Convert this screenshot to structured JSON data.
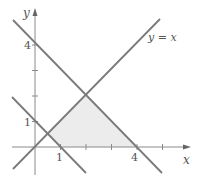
{
  "diagram": {
    "type": "linear-inequality-region",
    "axes": {
      "x_label": "x",
      "y_label": "y",
      "x_ticks": [
        1,
        2,
        3,
        4,
        5
      ],
      "y_ticks": [
        1,
        2,
        3,
        4
      ],
      "x_tick_labels": {
        "1": "1",
        "4": "4"
      },
      "y_tick_labels": {
        "1": "1",
        "4": "4"
      }
    },
    "lines": [
      {
        "id": "line-y-eq-x",
        "equation": "y = x",
        "label": "y = x"
      },
      {
        "id": "line-x-plus-y-eq-4",
        "equation": "x + y = 4",
        "label": ""
      },
      {
        "id": "line-x-plus-y-eq-1",
        "equation": "x + y = 1",
        "label": ""
      }
    ],
    "shaded_region": {
      "vertices": [
        [
          0.5,
          0.5
        ],
        [
          2,
          2
        ],
        [
          4,
          0
        ],
        [
          1,
          0
        ]
      ],
      "fill": "#ececec"
    },
    "colors": {
      "line": "#7a7a7a",
      "axis": "#8a8a8a",
      "text": "#555555",
      "shade": "#ececec"
    }
  },
  "labels": {
    "x_axis": "x",
    "y_axis": "y",
    "x_tick_1": "1",
    "x_tick_4": "4",
    "y_tick_1": "1",
    "y_tick_4": "4",
    "line_y_eq_x": "y = x"
  }
}
